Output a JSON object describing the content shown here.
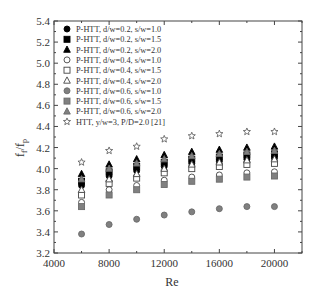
{
  "chart_data": {
    "type": "scatter",
    "title": "",
    "xlabel": "Re",
    "ylabel": "f_f/f_p",
    "xlim": [
      4000,
      22000
    ],
    "ylim": [
      3.2,
      5.4
    ],
    "x_ticks": [
      4000,
      8000,
      12000,
      16000,
      20000
    ],
    "y_ticks": [
      3.2,
      3.4,
      3.6,
      3.8,
      4.0,
      4.2,
      4.4,
      4.6,
      4.8,
      5.0,
      5.2,
      5.4
    ],
    "x_tick_labels": [
      "4000",
      "8000",
      "12000",
      "16000",
      "20000"
    ],
    "y_tick_labels": [
      "3.2",
      "3.4",
      "3.6",
      "3.8",
      "4.0",
      "4.2",
      "4.4",
      "4.6",
      "4.8",
      "5.0",
      "5.2",
      "5.4"
    ],
    "grid": false,
    "legend_position": "upper left",
    "x": [
      6000,
      8000,
      10000,
      12000,
      14000,
      16000,
      18000,
      20000
    ],
    "series": [
      {
        "name": "P-HTT, d/w=0.2, s/w=1.0",
        "marker": "circle",
        "fill": "#000000",
        "values": [
          3.84,
          3.93,
          3.98,
          4.02,
          4.05,
          4.07,
          4.09,
          4.1
        ]
      },
      {
        "name": "P-HTT, d/w=0.2, s/w=1.5",
        "marker": "square",
        "fill": "#000000",
        "values": [
          3.88,
          3.97,
          4.02,
          4.06,
          4.09,
          4.11,
          4.13,
          4.14
        ]
      },
      {
        "name": "P-HTT, d/w=0.2, s/w=2.0",
        "marker": "triangle",
        "fill": "#000000",
        "values": [
          3.95,
          4.04,
          4.09,
          4.13,
          4.16,
          4.18,
          4.2,
          4.21
        ]
      },
      {
        "name": "P-HTT, d/w=0.4, s/w=1.0",
        "marker": "circle",
        "fill": "none",
        "values": [
          3.68,
          3.8,
          3.84,
          3.89,
          3.92,
          3.94,
          3.96,
          3.97
        ]
      },
      {
        "name": "P-HTT, d/w=0.4, s/w=1.5",
        "marker": "square",
        "fill": "none",
        "values": [
          3.75,
          3.86,
          3.91,
          3.96,
          4.0,
          4.02,
          4.04,
          4.05
        ]
      },
      {
        "name": "P-HTT, d/w=0.4, s/w=2.0",
        "marker": "triangle",
        "fill": "none",
        "values": [
          3.8,
          3.9,
          3.95,
          4.0,
          4.04,
          4.06,
          4.08,
          4.09
        ]
      },
      {
        "name": "P-HTT, d/w=0.6, s/w=1.0",
        "marker": "circle",
        "fill": "#808080",
        "values": [
          3.38,
          3.47,
          3.52,
          3.56,
          3.59,
          3.62,
          3.64,
          3.64
        ]
      },
      {
        "name": "P-HTT, d/w=0.6, s/w=1.5",
        "marker": "square",
        "fill": "#808080",
        "values": [
          3.64,
          3.75,
          3.8,
          3.85,
          3.88,
          3.9,
          3.92,
          3.93
        ]
      },
      {
        "name": "P-HTT, d/w=0.6, s/w=2.0",
        "marker": "triangle",
        "fill": "#808080",
        "values": [
          3.9,
          4.0,
          4.05,
          4.09,
          4.12,
          4.14,
          4.16,
          4.17
        ]
      },
      {
        "name": "HTT, y/w=3, P/D=2.0 [21]",
        "marker": "star",
        "fill": "none",
        "values": [
          4.06,
          4.17,
          4.21,
          4.28,
          4.31,
          4.33,
          4.35,
          4.35
        ]
      }
    ]
  },
  "legend": {
    "items": [
      "P-HTT, d/w=0.2, s/w=1.0",
      "P-HTT, d/w=0.2, s/w=1.5",
      "P-HTT, d/w=0.2, s/w=2.0",
      "P-HTT, d/w=0.4, s/w=1.0",
      "P-HTT, d/w=0.4, s/w=1.5",
      "P-HTT, d/w=0.4, s/w=2.0",
      "P-HTT, d/w=0.6, s/w=1.0",
      "P-HTT, d/w=0.6, s/w=1.5",
      "P-HTT, d/w=0.6, s/w=2.0",
      "HTT, y/w=3, P/D=2.0 [21]"
    ]
  },
  "axes": {
    "xlabel": "Re",
    "ylabel_main": "f",
    "ylabel_sub1": "f",
    "ylabel_slash": "/f",
    "ylabel_sub2": "p"
  }
}
